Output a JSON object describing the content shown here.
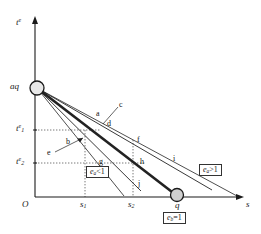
{
  "figure": {
    "axes": {
      "y_label": "t",
      "y_label_sup": "e",
      "x_label": "s",
      "origin_label": "O"
    },
    "y_ticks": [
      {
        "name": "t1",
        "label": "t",
        "sup": "e",
        "sub": "1"
      },
      {
        "name": "t2",
        "label": "t",
        "sup": "e",
        "sub": "2"
      }
    ],
    "x_ticks": [
      {
        "name": "s1",
        "label": "s",
        "sub": "1"
      },
      {
        "name": "s2",
        "label": "s",
        "sub": "2"
      }
    ],
    "markers": [
      {
        "name": "aq",
        "label": "aq",
        "axis": "y"
      },
      {
        "name": "q",
        "label": "q",
        "axis": "x"
      }
    ],
    "point_labels": [
      {
        "id": "a",
        "text": "a"
      },
      {
        "id": "b",
        "text": "b"
      },
      {
        "id": "c",
        "text": "c"
      },
      {
        "id": "d",
        "text": "d"
      },
      {
        "id": "e",
        "text": "e"
      },
      {
        "id": "f",
        "text": "f"
      },
      {
        "id": "g",
        "text": "g"
      },
      {
        "id": "h",
        "text": "h"
      },
      {
        "id": "i",
        "text": "i"
      },
      {
        "id": "j",
        "text": "j"
      }
    ],
    "annotations": [
      {
        "id": "ea_lt",
        "sym": "e",
        "sub": "a",
        "rel": "<1"
      },
      {
        "id": "ea_gt",
        "sym": "e",
        "sub": "a",
        "rel": ">1"
      },
      {
        "id": "eb_eq",
        "sym": "e",
        "sub": "b",
        "rel": "=1"
      }
    ],
    "colors": {
      "ink": "#1a1a1a",
      "line": "#222222",
      "marker_fill": "#d9d9d9",
      "dotted": "#555555"
    }
  }
}
